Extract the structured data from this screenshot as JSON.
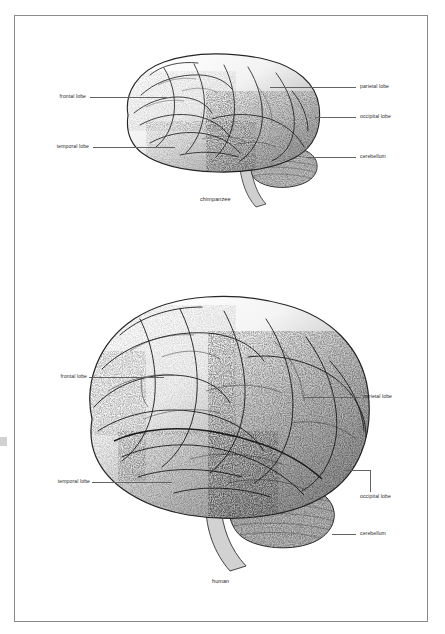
{
  "plate": {
    "background_color": "#ffffff",
    "border_color": "#8b8b8b",
    "ink_color": "#1d1d1d",
    "leader_color": "#636363"
  },
  "figures": [
    {
      "id": "chimpanzee-brain",
      "caption": "chimpanzee",
      "view": "lateral",
      "labels": [
        {
          "id": "frontal-lobe",
          "text": "frontal lobe",
          "side": "left"
        },
        {
          "id": "temporal-lobe",
          "text": "temporal lobe",
          "side": "left"
        },
        {
          "id": "parietal-lobe",
          "text": "parietal lobe",
          "side": "right"
        },
        {
          "id": "occipital-lobe",
          "text": "occipital lobe",
          "side": "right"
        },
        {
          "id": "cerebellum",
          "text": "cerebellum",
          "side": "right"
        }
      ]
    },
    {
      "id": "human-brain",
      "caption": "human",
      "view": "lateral",
      "labels": [
        {
          "id": "frontal-lobe",
          "text": "frontal lobe",
          "side": "left"
        },
        {
          "id": "temporal-lobe",
          "text": "temporal lobe",
          "side": "left"
        },
        {
          "id": "parietal-lobe",
          "text": "parietal lobe",
          "side": "right"
        },
        {
          "id": "occipital-lobe",
          "text": "occipital lobe",
          "side": "right"
        },
        {
          "id": "cerebellum",
          "text": "cerebellum",
          "side": "right"
        }
      ]
    }
  ]
}
